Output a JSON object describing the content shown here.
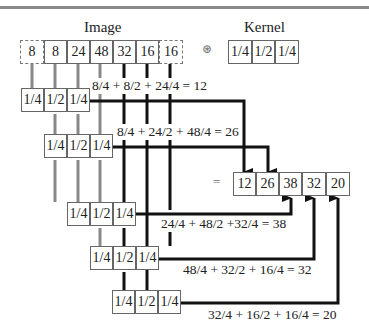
{
  "image": {
    "label": "Image",
    "values": [
      "8",
      "8",
      "24",
      "48",
      "32",
      "16",
      "16"
    ],
    "padded_indices": [
      0,
      6
    ]
  },
  "operator": {
    "symbol": "⊛"
  },
  "kernel": {
    "label": "Kernel",
    "values": [
      "1/4",
      "1/2",
      "1/4"
    ]
  },
  "steps": [
    {
      "kernel": [
        "1/4",
        "1/2",
        "1/4"
      ],
      "equation": "8/4 + 8/2 + 24/4 = 12"
    },
    {
      "kernel": [
        "1/4",
        "1/2",
        "1/4"
      ],
      "equation": "8/4 + 24/2 + 48/4 = 26"
    },
    {
      "kernel": [
        "1/4",
        "1/2",
        "1/4"
      ],
      "equation": "24/4 + 48/2 +32/4 = 38"
    },
    {
      "kernel": [
        "1/4",
        "1/2",
        "1/4"
      ],
      "equation": "48/4 + 32/2 + 16/4 = 32"
    },
    {
      "kernel": [
        "1/4",
        "1/2",
        "1/4"
      ],
      "equation": "32/4 + 16/2 + 16/4 = 20"
    }
  ],
  "result": {
    "equals": "=",
    "values": [
      "12",
      "26",
      "38",
      "32",
      "20"
    ]
  },
  "colors": {
    "line_dark": "#111111",
    "line_gray": "#777777",
    "border": "#666666"
  }
}
